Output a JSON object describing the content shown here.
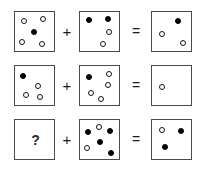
{
  "puzzle": {
    "title": "Dot pattern addition puzzle",
    "operators": {
      "plus": "+",
      "equals": "="
    },
    "unknown_marker": "?",
    "colors": {
      "filled_dot": "#000000",
      "open_dot_stroke": "#141414",
      "box_border": "#4a4a4a",
      "background": "#ffffff"
    },
    "rows": [
      {
        "id": "row-1",
        "operands": [
          {
            "id": "row1-box1",
            "type": "dots",
            "filled_count": 1,
            "open_count": 4,
            "dots": [
              {
                "fill": "open",
                "x": 6,
                "y": 6
              },
              {
                "fill": "open",
                "x": 25,
                "y": 4
              },
              {
                "fill": "filled",
                "x": 16,
                "y": 17
              },
              {
                "fill": "open",
                "x": 4,
                "y": 27
              },
              {
                "fill": "open",
                "x": 24,
                "y": 29
              }
            ]
          },
          {
            "id": "row1-box2",
            "type": "dots",
            "filled_count": 2,
            "open_count": 2,
            "dots": [
              {
                "fill": "filled",
                "x": 6,
                "y": 5
              },
              {
                "fill": "filled",
                "x": 25,
                "y": 4
              },
              {
                "fill": "open",
                "x": 26,
                "y": 17
              },
              {
                "fill": "open",
                "x": 20,
                "y": 29
              }
            ]
          },
          {
            "id": "row1-box3",
            "type": "dots",
            "filled_count": 1,
            "open_count": 2,
            "dots": [
              {
                "fill": "filled",
                "x": 23,
                "y": 6
              },
              {
                "fill": "open",
                "x": 7,
                "y": 19
              },
              {
                "fill": "open",
                "x": 28,
                "y": 28
              }
            ]
          }
        ]
      },
      {
        "id": "row-2",
        "operands": [
          {
            "id": "row2-box1",
            "type": "dots",
            "filled_count": 1,
            "open_count": 3,
            "dots": [
              {
                "fill": "filled",
                "x": 5,
                "y": 7
              },
              {
                "fill": "open",
                "x": 20,
                "y": 17
              },
              {
                "fill": "open",
                "x": 8,
                "y": 26
              },
              {
                "fill": "open",
                "x": 22,
                "y": 28
              }
            ]
          },
          {
            "id": "row2-box2",
            "type": "dots",
            "filled_count": 1,
            "open_count": 4,
            "dots": [
              {
                "fill": "filled",
                "x": 6,
                "y": 8
              },
              {
                "fill": "open",
                "x": 26,
                "y": 5
              },
              {
                "fill": "open",
                "x": 25,
                "y": 16
              },
              {
                "fill": "open",
                "x": 8,
                "y": 24
              },
              {
                "fill": "open",
                "x": 18,
                "y": 30
              }
            ]
          },
          {
            "id": "row2-box3",
            "type": "dots",
            "filled_count": 0,
            "open_count": 1,
            "dots": [
              {
                "fill": "open",
                "x": 7,
                "y": 18
              }
            ]
          }
        ]
      },
      {
        "id": "row-3",
        "operands": [
          {
            "id": "row3-box1",
            "type": "unknown",
            "label": "?",
            "filled_count": 0,
            "open_count": 0,
            "dots": []
          },
          {
            "id": "row3-box2",
            "type": "dots",
            "filled_count": 4,
            "open_count": 2,
            "dots": [
              {
                "fill": "filled",
                "x": 5,
                "y": 9
              },
              {
                "fill": "open",
                "x": 16,
                "y": 4
              },
              {
                "fill": "filled",
                "x": 27,
                "y": 8
              },
              {
                "fill": "filled",
                "x": 17,
                "y": 19
              },
              {
                "fill": "open",
                "x": 4,
                "y": 25
              },
              {
                "fill": "filled",
                "x": 28,
                "y": 30
              }
            ]
          },
          {
            "id": "row3-box3",
            "type": "dots",
            "filled_count": 2,
            "open_count": 1,
            "dots": [
              {
                "fill": "open",
                "x": 7,
                "y": 7
              },
              {
                "fill": "filled",
                "x": 26,
                "y": 8
              },
              {
                "fill": "filled",
                "x": 10,
                "y": 24
              }
            ]
          }
        ]
      }
    ],
    "row_tops": [
      11,
      65,
      119
    ]
  }
}
